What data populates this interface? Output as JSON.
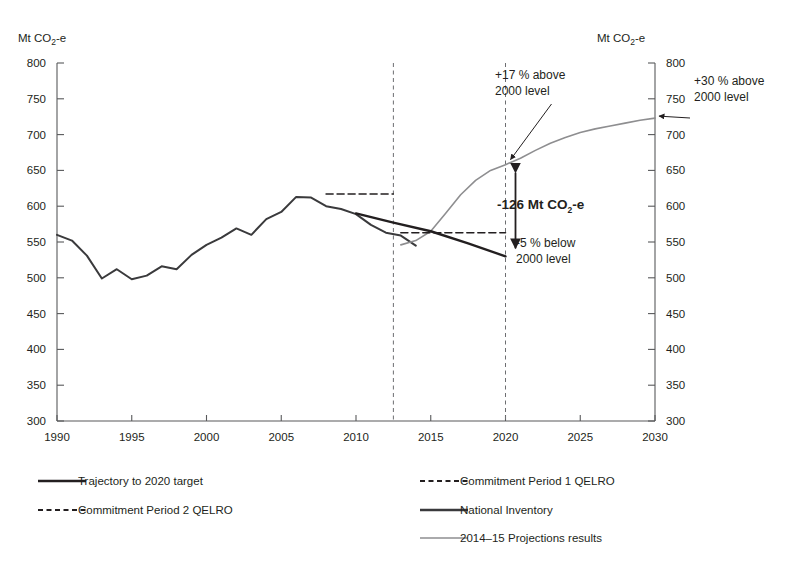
{
  "chart_data": {
    "type": "line",
    "title": "",
    "xlabel": "",
    "ylabel": "Mt CO2-e",
    "ylabel_right": "Mt CO2-e",
    "xlim": [
      1990,
      2030
    ],
    "ylim": [
      300,
      800
    ],
    "xticks": [
      1990,
      1995,
      2000,
      2005,
      2010,
      2015,
      2020,
      2025,
      2030
    ],
    "xtick_labels": [
      "1990",
      "1995",
      "2000",
      "2005",
      "2010",
      "2015",
      "2020",
      "2025",
      "2030"
    ],
    "yticks": [
      300,
      350,
      400,
      450,
      500,
      550,
      600,
      650,
      700,
      750,
      800
    ],
    "ytick_labels": [
      "300",
      "350",
      "400",
      "450",
      "500",
      "550",
      "600",
      "650",
      "700",
      "750",
      "800"
    ],
    "grid": false,
    "legend_position": "bottom",
    "series": [
      {
        "name": "National Inventory",
        "style": "solid",
        "color": "#3a3a3c",
        "width": 2.0,
        "x": [
          1990,
          1991,
          1992,
          1993,
          1994,
          1995,
          1996,
          1997,
          1998,
          1999,
          2000,
          2001,
          2002,
          2003,
          2004,
          2005,
          2006,
          2007,
          2008,
          2009,
          2010,
          2011,
          2012,
          2013,
          2014
        ],
        "values": [
          560,
          552,
          531,
          499,
          512,
          498,
          503,
          516,
          512,
          532,
          546,
          556,
          569,
          560,
          582,
          592,
          613,
          612,
          600,
          596,
          589,
          574,
          563,
          559,
          545
        ]
      },
      {
        "name": "2014-15 Projections results",
        "style": "solid",
        "color": "#8e8e90",
        "width": 1.6,
        "x": [
          2013,
          2014,
          2015,
          2016,
          2017,
          2018,
          2019,
          2020,
          2021,
          2022,
          2023,
          2024,
          2025,
          2026,
          2027,
          2028,
          2029,
          2030
        ],
        "values": [
          546,
          552,
          565,
          590,
          616,
          636,
          650,
          658,
          667,
          678,
          688,
          696,
          703,
          708,
          712,
          716,
          720,
          723
        ]
      },
      {
        "name": "Trajectory to 2020 target",
        "style": "solid",
        "color": "#231f20",
        "width": 2.4,
        "x": [
          2010,
          2012.5,
          2015,
          2017.5,
          2020
        ],
        "values": [
          590,
          577,
          565,
          548,
          530
        ]
      },
      {
        "name": "Commitment Period 1 QELRO",
        "style": "dashed",
        "color": "#231f20",
        "width": 1.6,
        "x": [
          2008,
          2012.5
        ],
        "values": [
          617,
          617
        ]
      },
      {
        "name": "Commitment Period 2 QELRO",
        "style": "dashed",
        "color": "#231f20",
        "width": 1.6,
        "x": [
          2013,
          2020
        ],
        "values": [
          563,
          563
        ]
      }
    ],
    "reference_lines": [
      {
        "name": "cp1-end-2012",
        "x": 2012.5,
        "style": "dashed",
        "color": "#6d6e71"
      },
      {
        "name": "target-year-2020",
        "x": 2020,
        "style": "dashed",
        "color": "#6d6e71"
      }
    ],
    "annotations": [
      {
        "name": "projection-2020-label",
        "line1": "+17 % above",
        "line2": "2000 level",
        "value": 658,
        "year": 2020
      },
      {
        "name": "projection-2030-label",
        "line1": "+30 % above",
        "line2": "2000 level",
        "value": 723,
        "year": 2030
      },
      {
        "name": "trajectory-2020-label",
        "line1": "-5 % below",
        "line2": "2000 level",
        "value": 530,
        "year": 2020
      },
      {
        "name": "abatement-gap-label",
        "text_prefix": "-126 Mt CO",
        "text_sub": "2",
        "text_suffix": "-e",
        "value": 126,
        "year": 2020
      }
    ]
  },
  "axis": {
    "unit_left_prefix": "Mt CO",
    "unit_left_sub": "2",
    "unit_left_suffix": "-e",
    "unit_right_prefix": "Mt CO",
    "unit_right_sub": "2",
    "unit_right_suffix": "-e"
  },
  "legend": {
    "items": [
      {
        "label": "Trajectory to 2020 target",
        "style": "solid-thick",
        "color": "#231f20"
      },
      {
        "label": "Commitment Period 1 QELRO",
        "style": "dashed",
        "color": "#231f20"
      },
      {
        "label": "Commitment Period 2 QELRO",
        "style": "dashed",
        "color": "#231f20"
      },
      {
        "label": "National Inventory",
        "style": "solid-thick",
        "color": "#3a3a3c"
      },
      {
        "label": "2014–15 Projections results",
        "style": "solid-thin",
        "color": "#8e8e90"
      }
    ]
  }
}
